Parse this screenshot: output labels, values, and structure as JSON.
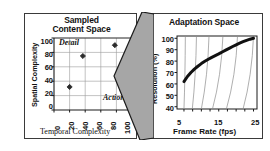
{
  "figure": {
    "background": "#ffffff",
    "border_color": "#3a3a3a"
  },
  "left_panel": {
    "title_line1": "Sampled",
    "title_line2": "Content Space",
    "annotation_detail": "Detail",
    "annotation_action": "Action"
  },
  "right_panel": {
    "title": "Adaptation Space"
  },
  "arrow": {
    "name": "mapping-arrow",
    "direction": "left",
    "fill": "#a6a6a6",
    "stroke": "#1a1a1a"
  },
  "chart_data": [
    {
      "type": "scatter",
      "id": "sampled-content-space",
      "title": "Sampled Content Space",
      "xlabel": "Temporal Complexity",
      "ylabel": "Spatial Complexity",
      "xlim": [
        0,
        100
      ],
      "ylim": [
        0,
        100
      ],
      "xticks": [
        0,
        20,
        40,
        60,
        80,
        100
      ],
      "yticks": [
        0,
        20,
        40,
        60,
        80,
        100
      ],
      "xticklabels": [
        "0",
        "20",
        "40",
        "60",
        "80",
        "100"
      ],
      "yticklabels": [
        "0",
        "20",
        "40",
        "60",
        "80",
        "100"
      ],
      "xtick_rotation": 90,
      "grid": true,
      "grid_color": "#9a9a9a",
      "legend": "none",
      "marker": "diamond",
      "marker_color": "#2b2b2b",
      "points": [
        {
          "x": 20,
          "y": 32
        },
        {
          "x": 37,
          "y": 75
        },
        {
          "x": 78,
          "y": 90
        }
      ],
      "annotations": [
        {
          "text": "Detail",
          "x": 8,
          "y": 91
        },
        {
          "text": "Action",
          "x": 72,
          "y": 9
        }
      ]
    },
    {
      "type": "line",
      "id": "adaptation-space",
      "title": "Adaptation Space",
      "xlabel": "Frame Rate (fps)",
      "ylabel": "Resolution (%)",
      "xlim": [
        3,
        26
      ],
      "ylim": [
        38,
        102
      ],
      "xticks": [
        5,
        15,
        25
      ],
      "yticks": [
        40,
        50,
        60,
        70,
        80,
        90,
        100
      ],
      "xticklabels": [
        "5",
        "15",
        "25"
      ],
      "yticklabels": [
        "40",
        "50",
        "60",
        "70",
        "80",
        "90",
        "100"
      ],
      "grid": false,
      "legend": "none",
      "series": [
        {
          "name": "operating-curve",
          "style": "thick-solid",
          "color": "#111111",
          "width": 3,
          "x": [
            5,
            6,
            7,
            8,
            9,
            10,
            11,
            12,
            13,
            14,
            15,
            16,
            17,
            18,
            19,
            20,
            21,
            22,
            23,
            24,
            25
          ],
          "y": [
            62,
            66.5,
            70,
            73,
            75.5,
            77.8,
            79.8,
            81.6,
            83.3,
            84.8,
            86.3,
            88,
            89.6,
            91.2,
            92.8,
            94.3,
            95.7,
            97,
            98.2,
            99.2,
            100
          ]
        },
        {
          "name": "iso-bitrate-curves",
          "style": "thin-solid-fan",
          "color": "#8c8c8c",
          "width": 0.7,
          "curves": [
            {
              "top_x": 5.4,
              "bottom_x": 5.0
            },
            {
              "top_x": 8.6,
              "bottom_x": 7.4
            },
            {
              "top_x": 12.2,
              "bottom_x": 10.0
            },
            {
              "top_x": 16.2,
              "bottom_x": 13.2
            },
            {
              "top_x": 20.4,
              "bottom_x": 17.2
            },
            {
              "top_x": 25.0,
              "bottom_x": 22.0
            }
          ]
        }
      ]
    }
  ]
}
